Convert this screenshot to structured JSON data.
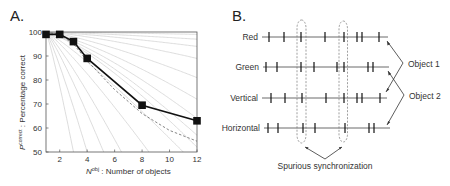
{
  "panels": {
    "a": {
      "letter": "A."
    },
    "b": {
      "letter": "B."
    }
  },
  "chart_data": [
    {
      "type": "line",
      "panel": "A",
      "title": "",
      "xlabel": "N obj : Number of objects",
      "xlabel_main": "N",
      "xlabel_sup": "obj",
      "xlabel_rest": " : Number of objects",
      "ylabel": "P correct : Percentage correct",
      "ylabel_main": "P",
      "ylabel_sup": "correct",
      "ylabel_rest": " : Percentage correct",
      "xlim": [
        1,
        12
      ],
      "ylim": [
        50,
        100
      ],
      "xticks": [
        2,
        4,
        6,
        8,
        10,
        12
      ],
      "yticks": [
        50,
        60,
        70,
        80,
        90,
        100
      ],
      "grid": false,
      "series": [
        {
          "name": "Measured",
          "style": "solid black with square markers",
          "x": [
            1,
            2,
            3,
            4,
            8,
            12
          ],
          "y": [
            99,
            99,
            96,
            89,
            69.5,
            63
          ]
        },
        {
          "name": "Model (dashed)",
          "style": "dashed gray",
          "x": [
            1,
            2,
            3,
            4,
            6,
            8,
            10,
            12
          ],
          "y": [
            100,
            99,
            95,
            88,
            76,
            66,
            59,
            54.5
          ]
        }
      ],
      "background_curves": {
        "description": "family of light gray decay curves fanning from (1,100)",
        "end_values_at_12": [
          99,
          97,
          94,
          89,
          81,
          72,
          64,
          57,
          52
        ],
        "steep_curves_reaching_50_at_x": [
          3.0,
          4.0,
          5.2,
          6.5,
          8.5,
          11
        ]
      }
    }
  ],
  "diagram": {
    "rows": [
      {
        "label": "Red",
        "y": 37,
        "line_x": [
          262,
          388
        ],
        "spikes": [
          269,
          284,
          301,
          325,
          344,
          357,
          362,
          379
        ]
      },
      {
        "label": "Green",
        "y": 67,
        "line_x": [
          263,
          389
        ],
        "spikes": [
          266,
          277,
          301,
          314,
          337,
          344,
          368,
          373
        ]
      },
      {
        "label": "Vertical",
        "y": 98,
        "line_x": [
          262,
          387
        ],
        "spikes": [
          271,
          285,
          302,
          326,
          344,
          357,
          362,
          380
        ]
      },
      {
        "label": "Horizontal",
        "y": 128,
        "line_x": [
          264,
          390
        ],
        "spikes": [
          268,
          278,
          303,
          315,
          345,
          369,
          374
        ]
      }
    ],
    "objects": [
      {
        "label": "Object 1",
        "targets": [
          "Red",
          "Vertical"
        ]
      },
      {
        "label": "Object 2",
        "targets": [
          "Green",
          "Horizontal"
        ]
      }
    ],
    "spurious_label": "Spurious synchronization"
  }
}
